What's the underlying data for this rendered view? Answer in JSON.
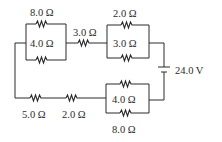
{
  "diagram": {
    "type": "circuit",
    "battery": {
      "label": "24.0 V"
    },
    "resistors": {
      "top_left_upper": "8.0 Ω",
      "top_left_lower": "4.0 Ω",
      "top_series": "3.0 Ω",
      "top_right_upper": "2.0 Ω",
      "top_right_lower": "3.0 Ω",
      "bottom_series_left": "5.0 Ω",
      "bottom_series_right": "2.0 Ω",
      "bottom_right_upper": "4.0 Ω",
      "bottom_right_lower": "8.0 Ω"
    }
  }
}
